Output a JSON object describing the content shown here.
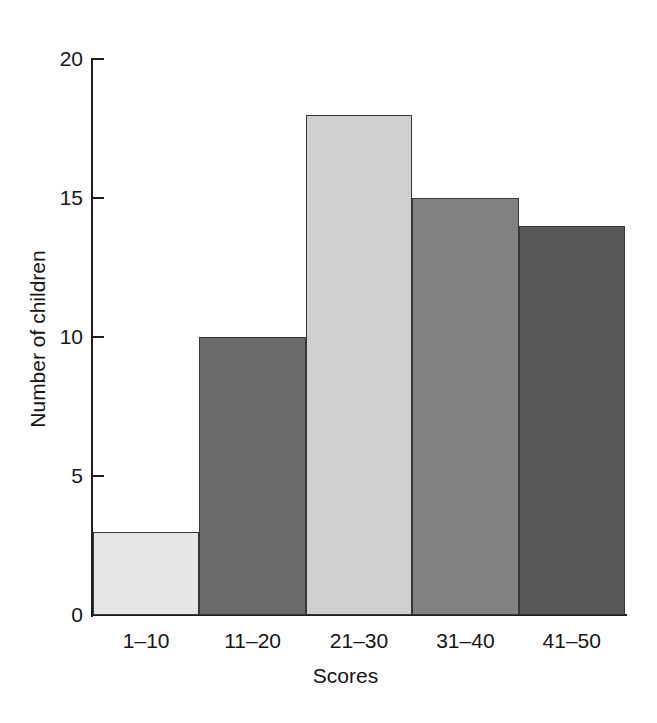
{
  "chart_data": {
    "type": "bar",
    "title": "",
    "title_note": "title row is cropped off the top of the screenshot and is illegible",
    "categories": [
      "1–10",
      "11–20",
      "21–30",
      "31–40",
      "41–50"
    ],
    "values": [
      3,
      10,
      18,
      15,
      14
    ],
    "series": [
      {
        "name": "Number of children",
        "values": [
          3,
          10,
          18,
          15,
          14
        ]
      }
    ],
    "xlabel": "Scores",
    "ylabel": "Number of children",
    "ylim": [
      0,
      20
    ],
    "yticks": [
      0,
      5,
      10,
      15,
      20
    ],
    "ytick_labels": [
      "0",
      "5",
      "10",
      "15",
      "20"
    ],
    "grid": false,
    "legend": false,
    "bar_colors": [
      "#ececec",
      "#6e6e6e",
      "#d5d5d5",
      "#858585",
      "#5a5a5a"
    ],
    "bar_edge_color": "#33393a",
    "axis_color": "#1d1d1d",
    "background": "#ffffff"
  }
}
